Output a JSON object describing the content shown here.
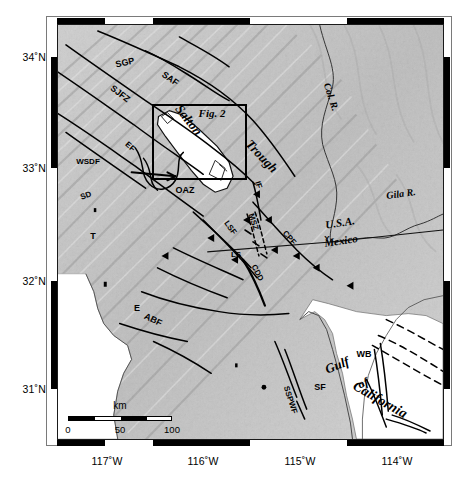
{
  "figure": {
    "type": "map",
    "projection_note": "geographic"
  },
  "axes": {
    "x_ticks": [
      {
        "label": "117˚W",
        "lon": -117,
        "x": 107
      },
      {
        "label": "116˚W",
        "lon": -116,
        "x": 203
      },
      {
        "label": "115˚W",
        "lon": -115,
        "x": 300
      },
      {
        "label": "114˚W",
        "lon": -114,
        "x": 397
      }
    ],
    "y_ticks": [
      {
        "label": "34˚N",
        "lat": 34,
        "y": 57
      },
      {
        "label": "33˚N",
        "lat": 33,
        "y": 168
      },
      {
        "label": "32˚N",
        "lat": 32,
        "y": 281
      },
      {
        "label": "31˚N",
        "lat": 31,
        "y": 389
      }
    ]
  },
  "scalebar": {
    "unit_label": "km",
    "ticks": [
      "0",
      "50",
      "100"
    ],
    "length_km": 100
  },
  "inset": {
    "label": "Fig. 2",
    "box": {
      "x": 152,
      "y": 104,
      "w": 95,
      "h": 76
    }
  },
  "map_labels": [
    {
      "id": "sgp",
      "text": "SGP",
      "x": 125,
      "y": 63,
      "rot": -13,
      "size": 9,
      "style": "bold"
    },
    {
      "id": "saf",
      "text": "SAF",
      "x": 170,
      "y": 79,
      "rot": 35,
      "size": 9,
      "style": "bold"
    },
    {
      "id": "sjfz",
      "text": "SJFZ",
      "x": 120,
      "y": 94,
      "rot": 38,
      "size": 9,
      "style": "bold"
    },
    {
      "id": "ef",
      "text": "EF",
      "x": 130,
      "y": 147,
      "rot": 42,
      "size": 8,
      "style": "bold"
    },
    {
      "id": "wsdf",
      "text": "WSDF",
      "x": 88,
      "y": 162,
      "rot": 0,
      "size": 8,
      "style": "bold"
    },
    {
      "id": "sd",
      "text": "SD",
      "x": 86,
      "y": 196,
      "rot": -20,
      "size": 8,
      "style": "bold"
    },
    {
      "id": "t",
      "text": "T",
      "x": 93,
      "y": 236,
      "rot": 0,
      "size": 9,
      "style": "bold"
    },
    {
      "id": "salton",
      "text": "Salton",
      "x": 189,
      "y": 120,
      "rot": 52,
      "size": 13,
      "style": "serif-italic"
    },
    {
      "id": "fig2",
      "text": "Fig. 2",
      "x": 212,
      "y": 113,
      "rot": 0,
      "size": 11,
      "style": "serif-italic"
    },
    {
      "id": "trough",
      "text": "Trough",
      "x": 262,
      "y": 156,
      "rot": 46,
      "size": 13,
      "style": "serif-italic"
    },
    {
      "id": "colr",
      "text": "Col. R.",
      "x": 331,
      "y": 97,
      "rot": 72,
      "size": 10,
      "style": "serif-italic"
    },
    {
      "id": "gilar",
      "text": "Gila R.",
      "x": 401,
      "y": 194,
      "rot": -8,
      "size": 10,
      "style": "serif-italic"
    },
    {
      "id": "usa",
      "text": "U.S.A.",
      "x": 340,
      "y": 223,
      "rot": -9,
      "size": 11,
      "style": "serif-italic"
    },
    {
      "id": "mexico",
      "text": "Mexico",
      "x": 341,
      "y": 241,
      "rot": -9,
      "size": 11,
      "style": "serif-italic"
    },
    {
      "id": "oaz",
      "text": "OAZ",
      "x": 185,
      "y": 190,
      "rot": 0,
      "size": 9,
      "style": "bold"
    },
    {
      "id": "if",
      "text": "IF",
      "x": 258,
      "y": 185,
      "rot": 72,
      "size": 8,
      "style": "bold"
    },
    {
      "id": "msz",
      "text": "MSZ",
      "x": 253,
      "y": 222,
      "rot": 72,
      "size": 8,
      "style": "bold"
    },
    {
      "id": "cpf",
      "text": "CPF",
      "x": 289,
      "y": 238,
      "rot": 48,
      "size": 8,
      "style": "bold"
    },
    {
      "id": "lsf",
      "text": "LSF",
      "x": 230,
      "y": 228,
      "rot": 55,
      "size": 8,
      "style": "bold"
    },
    {
      "id": "ls",
      "text": "LS",
      "x": 236,
      "y": 255,
      "rot": 0,
      "size": 8,
      "style": "bold"
    },
    {
      "id": "cdd",
      "text": "CDD",
      "x": 257,
      "y": 273,
      "rot": 62,
      "size": 8,
      "style": "bold"
    },
    {
      "id": "y",
      "text": "Y",
      "x": 327,
      "y": 239,
      "rot": 0,
      "size": 8,
      "style": "bold"
    },
    {
      "id": "e",
      "text": "E",
      "x": 137,
      "y": 308,
      "rot": 0,
      "size": 9,
      "style": "bold"
    },
    {
      "id": "abf",
      "text": "ABF",
      "x": 153,
      "y": 320,
      "rot": 26,
      "size": 9,
      "style": "bold"
    },
    {
      "id": "sf",
      "text": "SF",
      "x": 320,
      "y": 387,
      "rot": 0,
      "size": 9,
      "style": "bold"
    },
    {
      "id": "sspwf",
      "text": "SSPWF",
      "x": 290,
      "y": 400,
      "rot": 72,
      "size": 8,
      "style": "bold"
    },
    {
      "id": "wb",
      "text": "WB",
      "x": 364,
      "y": 354,
      "rot": 0,
      "size": 9,
      "style": "bold"
    },
    {
      "id": "gulf",
      "text": "Gulf",
      "x": 337,
      "y": 365,
      "rot": -22,
      "size": 13,
      "style": "serif-italic"
    },
    {
      "id": "of",
      "text": "of",
      "x": 363,
      "y": 383,
      "rot": -22,
      "size": 12,
      "style": "serif-italic"
    },
    {
      "id": "california",
      "text": "California",
      "x": 380,
      "y": 400,
      "rot": 30,
      "size": 14,
      "style": "serif-italic"
    }
  ],
  "colors": {
    "land_light": "#e2e2e2",
    "land_mid": "#c5c5c5",
    "land_dark": "#9a9a9a",
    "water": "#ffffff",
    "fault_line": "#000000",
    "frame": "#000000"
  }
}
